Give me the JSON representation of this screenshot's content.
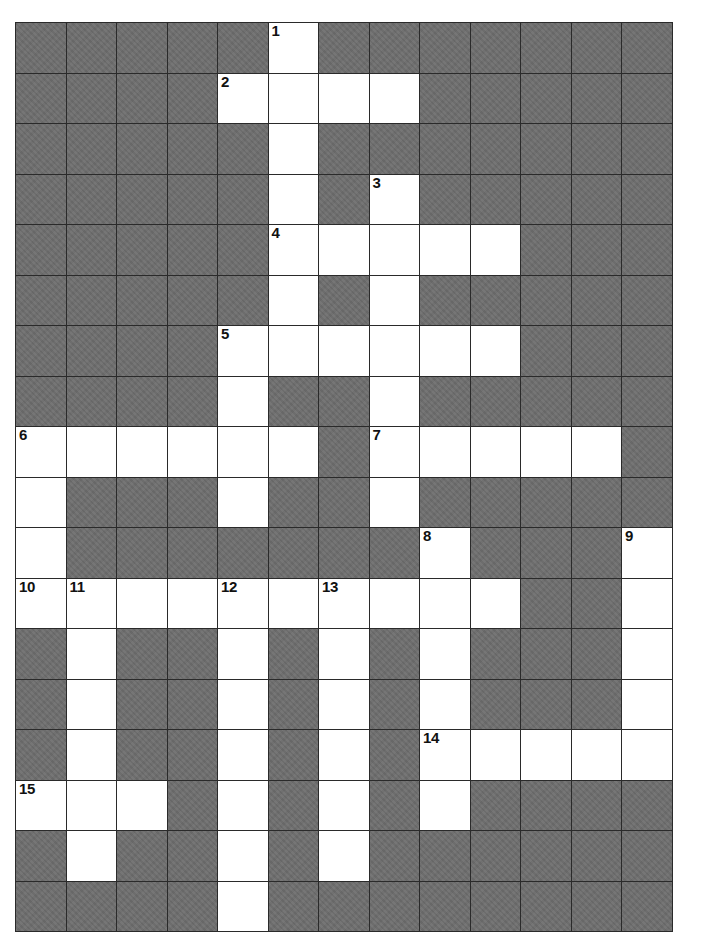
{
  "puzzle": {
    "kind": "crossword-grid",
    "rows": 18,
    "cols": 13,
    "cell_size_px": 50.5,
    "colors": {
      "block_fill": "#6e6e6e",
      "open_fill": "#ffffff",
      "grid_line": "#2a2a2a",
      "number_text": "#111111",
      "page_background": "#ffffff"
    },
    "legend": {
      "open": 1,
      "block": 0
    },
    "grid": [
      [
        0,
        0,
        0,
        0,
        0,
        1,
        0,
        0,
        0,
        0,
        0,
        0,
        0
      ],
      [
        0,
        0,
        0,
        0,
        1,
        1,
        1,
        1,
        0,
        0,
        0,
        0,
        0
      ],
      [
        0,
        0,
        0,
        0,
        0,
        1,
        0,
        0,
        0,
        0,
        0,
        0,
        0
      ],
      [
        0,
        0,
        0,
        0,
        0,
        1,
        0,
        1,
        0,
        0,
        0,
        0,
        0
      ],
      [
        0,
        0,
        0,
        0,
        0,
        1,
        1,
        1,
        1,
        1,
        0,
        0,
        0
      ],
      [
        0,
        0,
        0,
        0,
        0,
        1,
        0,
        1,
        0,
        0,
        0,
        0,
        0
      ],
      [
        0,
        0,
        0,
        0,
        1,
        1,
        1,
        1,
        1,
        1,
        0,
        0,
        0
      ],
      [
        0,
        0,
        0,
        0,
        1,
        0,
        0,
        1,
        0,
        0,
        0,
        0,
        0
      ],
      [
        1,
        1,
        1,
        1,
        1,
        1,
        0,
        1,
        1,
        1,
        1,
        1,
        0
      ],
      [
        1,
        0,
        0,
        0,
        1,
        0,
        0,
        1,
        0,
        0,
        0,
        0,
        0
      ],
      [
        1,
        0,
        0,
        0,
        0,
        0,
        0,
        0,
        1,
        0,
        0,
        0,
        1
      ],
      [
        1,
        1,
        1,
        1,
        1,
        1,
        1,
        1,
        1,
        1,
        0,
        0,
        1
      ],
      [
        0,
        1,
        0,
        0,
        1,
        0,
        1,
        0,
        1,
        0,
        0,
        0,
        1
      ],
      [
        0,
        1,
        0,
        0,
        1,
        0,
        1,
        0,
        1,
        0,
        0,
        0,
        1
      ],
      [
        0,
        1,
        0,
        0,
        1,
        0,
        1,
        0,
        1,
        1,
        1,
        1,
        1
      ],
      [
        1,
        1,
        1,
        0,
        1,
        0,
        1,
        0,
        1,
        0,
        0,
        0,
        0
      ],
      [
        0,
        1,
        0,
        0,
        1,
        0,
        1,
        0,
        0,
        0,
        0,
        0,
        0
      ],
      [
        0,
        0,
        0,
        0,
        1,
        0,
        0,
        0,
        0,
        0,
        0,
        0,
        0
      ]
    ],
    "numbers": [
      {
        "label": "1",
        "row": 0,
        "col": 5
      },
      {
        "label": "2",
        "row": 1,
        "col": 4
      },
      {
        "label": "3",
        "row": 3,
        "col": 7
      },
      {
        "label": "4",
        "row": 4,
        "col": 5
      },
      {
        "label": "5",
        "row": 6,
        "col": 4
      },
      {
        "label": "6",
        "row": 8,
        "col": 0
      },
      {
        "label": "7",
        "row": 8,
        "col": 7
      },
      {
        "label": "8",
        "row": 10,
        "col": 8
      },
      {
        "label": "9",
        "row": 10,
        "col": 12
      },
      {
        "label": "10",
        "row": 11,
        "col": 0
      },
      {
        "label": "11",
        "row": 11,
        "col": 1
      },
      {
        "label": "12",
        "row": 11,
        "col": 4
      },
      {
        "label": "13",
        "row": 11,
        "col": 6
      },
      {
        "label": "14",
        "row": 14,
        "col": 8
      },
      {
        "label": "15",
        "row": 15,
        "col": 0
      }
    ]
  }
}
